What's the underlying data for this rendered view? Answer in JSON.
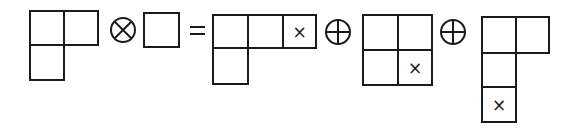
{
  "equation": {
    "description": "Young diagram tensor product decomposition",
    "operator_tensor": "⊗",
    "operator_equals": "=",
    "operator_direct_sum": "⊕",
    "marker": "×"
  },
  "terms": [
    {
      "role": "lhs-factor-1",
      "shape": [
        2,
        1
      ],
      "marked_cell": null
    },
    {
      "role": "lhs-factor-2",
      "shape": [
        1
      ],
      "marked_cell": null
    },
    {
      "role": "rhs-term-1",
      "shape": [
        3,
        1
      ],
      "marked_cell": {
        "row": 1,
        "col": 3
      }
    },
    {
      "role": "rhs-term-2",
      "shape": [
        2,
        2
      ],
      "marked_cell": {
        "row": 2,
        "col": 2
      }
    },
    {
      "role": "rhs-term-3",
      "shape": [
        2,
        1,
        1
      ],
      "marked_cell": {
        "row": 3,
        "col": 1
      }
    }
  ],
  "colors": {
    "stroke": "#1a1a1a",
    "background": "#ffffff"
  }
}
